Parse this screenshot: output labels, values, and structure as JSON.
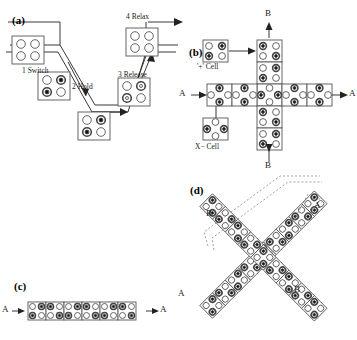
{
  "figure": {
    "panels": {
      "a": {
        "label": "(a)",
        "steps": [
          {
            "id": "switch",
            "label": "1 Switch"
          },
          {
            "id": "hold",
            "label": "2 Hold"
          },
          {
            "id": "release",
            "label": "3 Release"
          },
          {
            "id": "relax",
            "label": "4 Relax"
          }
        ]
      },
      "b": {
        "label": "(b)",
        "cells": {
          "plus": "'+' Cell",
          "x": "X− Cell"
        },
        "ports": {
          "top": "B",
          "bottom": "B",
          "left": "A",
          "right": "A"
        }
      },
      "c": {
        "label": "(c)",
        "ports": {
          "left": "A",
          "right": "A"
        },
        "cell_count": 6
      },
      "d": {
        "label": "(d)",
        "ports": {
          "upper_left": "B",
          "upper_right": "A",
          "lower_left": "A",
          "lower_right": "B"
        }
      }
    },
    "colors": {
      "background": "#ffffff",
      "ink": "#1a1a1a",
      "cell_stroke": "#555555",
      "dot_fill": "#111111",
      "dash_stroke": "#777777"
    }
  }
}
